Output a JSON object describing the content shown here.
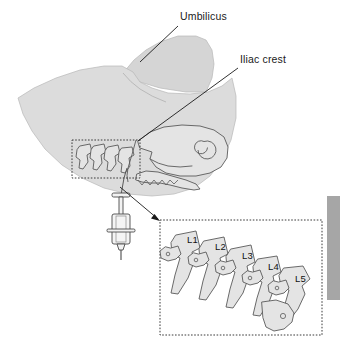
{
  "figure": {
    "background_color": "#ffffff"
  },
  "colors": {
    "skin_fill": "#dcdcdc",
    "skin_fill_upper": "#d5d5d5",
    "skin_stroke": "#b8b8b8",
    "bone_fill": "#e4e4e4",
    "bone_stroke": "#5a5a5a",
    "line_color": "#1a1a1a",
    "dotted_color": "#3a3a3a",
    "text_color": "#1a1a1a",
    "tab_gray": "#a6a6a6",
    "syringe_fill": "#f2f2f2",
    "syringe_stroke": "#4a4a4a"
  },
  "annotations": {
    "labels": [
      {
        "id": "umbilicus",
        "text": "Umbilicus",
        "text_x": 180,
        "text_y": 20,
        "leader": "M 178 26 L 140 62"
      },
      {
        "id": "iliac-crest",
        "text": "Iliac crest",
        "text_x": 240,
        "text_y": 63,
        "leader": "M 238 68 L 138 141"
      }
    ]
  },
  "inset": {
    "name": "lumbar-vertebrae-inset",
    "box": {
      "x": 160,
      "y": 220,
      "width": 162,
      "height": 115
    },
    "vertebrae": [
      {
        "id": "L1",
        "label": "L1",
        "label_x": 187,
        "label_y": 243
      },
      {
        "id": "L2",
        "label": "L2",
        "label_x": 215,
        "label_y": 250
      },
      {
        "id": "L3",
        "label": "L3",
        "label_x": 242,
        "label_y": 259
      },
      {
        "id": "L4",
        "label": "L4",
        "label_x": 268,
        "label_y": 270
      },
      {
        "id": "L5",
        "label": "L5",
        "label_x": 295,
        "label_y": 282
      }
    ]
  },
  "spine_box": {
    "name": "lumbar-spine-highlight-box",
    "x": 72,
    "y": 140,
    "width": 68,
    "height": 38
  },
  "pointer_arrow": {
    "name": "inset-pointer-arrow",
    "path": "M 122 188 L 160 221",
    "tip_x": 160,
    "tip_y": 221
  },
  "syringe": {
    "name": "syringe",
    "plunger_top_y": 195,
    "barrel_top_y": 213,
    "needle_tip_y": 258,
    "center_x": 121
  },
  "side_tab": {
    "name": "page-edge-tab",
    "x": 327,
    "y": 196,
    "width": 13,
    "height": 104,
    "color": "#a6a6a6"
  }
}
